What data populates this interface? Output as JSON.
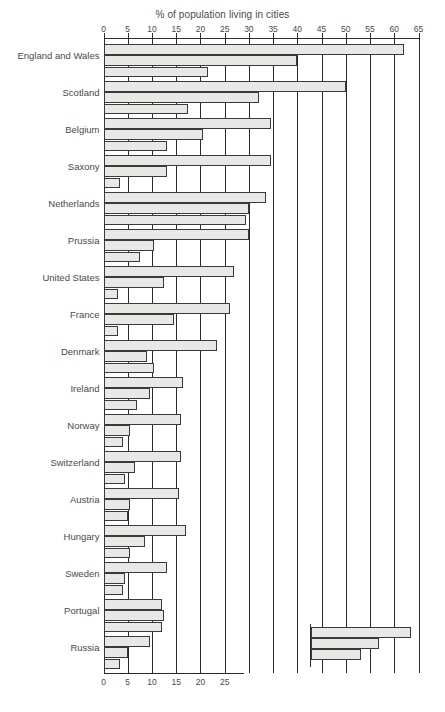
{
  "chart_data": {
    "type": "bar",
    "orientation": "horizontal",
    "title": "% of population living in cities",
    "xlabel": "",
    "ylabel": "",
    "xlim": [
      0,
      65
    ],
    "xticks": [
      0,
      5,
      10,
      15,
      20,
      25,
      30,
      35,
      40,
      45,
      50,
      55,
      60,
      65
    ],
    "xticks_bottom": [
      0,
      5,
      10,
      15,
      20,
      25
    ],
    "grid": true,
    "legend_position": "bottom-right",
    "categories": [
      "England and Wales",
      "Scotland",
      "Belgium",
      "Saxony",
      "Netherlands",
      "Prussia",
      "United States",
      "France",
      "Denmark",
      "Ireland",
      "Norway",
      "Switzerland",
      "Austria",
      "Hungary",
      "Sweden",
      "Portugal",
      "Russia"
    ],
    "series": [
      {
        "name": "1890",
        "values": [
          62,
          50,
          34.5,
          34.5,
          33.5,
          30,
          27,
          26,
          23.5,
          16.5,
          16,
          16,
          15.5,
          17,
          13,
          12,
          9.5
        ]
      },
      {
        "name": "1850",
        "values": [
          40,
          32,
          20.5,
          13,
          30,
          10.5,
          12.5,
          14.5,
          9,
          9.5,
          5.5,
          6.5,
          5.5,
          8.5,
          4.5,
          12.5,
          5
        ]
      },
      {
        "name": "1800",
        "values": [
          21.5,
          17.5,
          13,
          3.5,
          29.5,
          7.5,
          3,
          3,
          10.5,
          7,
          4,
          4.5,
          5,
          5.5,
          4,
          12,
          3.5
        ]
      }
    ]
  },
  "legend": {
    "title": "",
    "entries": [
      {
        "label": "1890",
        "length": 3
      },
      {
        "label": "1850",
        "length": 2
      },
      {
        "label": "1800",
        "length": 1.6
      }
    ]
  }
}
